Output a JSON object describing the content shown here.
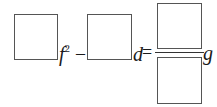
{
  "equation": {
    "term1": {
      "blank_label": "",
      "variable": "f",
      "exponent": "2"
    },
    "operator1": "–",
    "term2": {
      "blank_label": "",
      "variable": "d"
    },
    "equals": "=",
    "rhs": {
      "numerator_blank": "",
      "denominator_blank": "",
      "variable": "g"
    }
  },
  "colors": {
    "box_border": "#555555",
    "text": "#1a1a1a",
    "background": "#ffffff"
  }
}
